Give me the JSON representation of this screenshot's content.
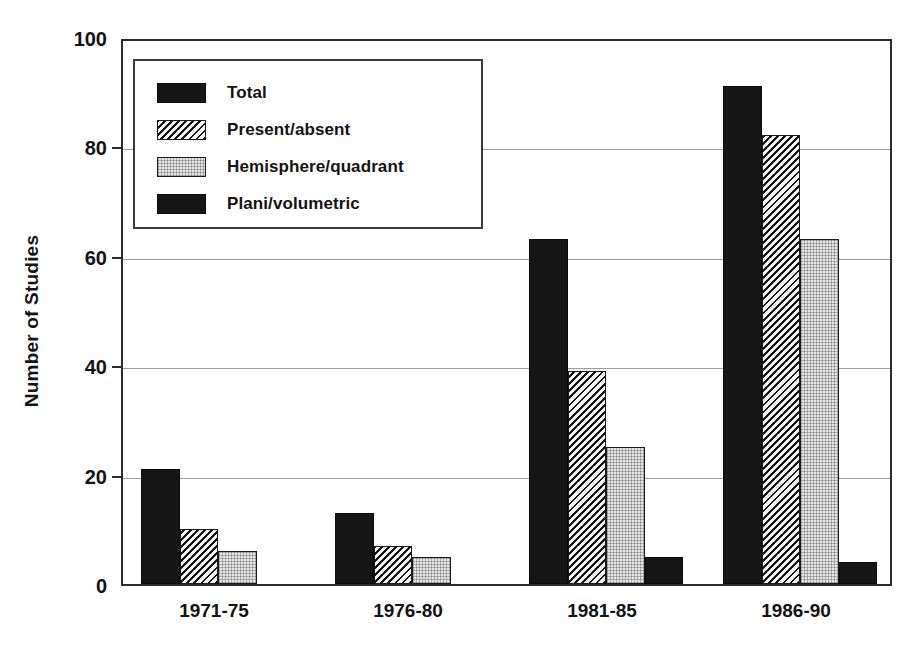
{
  "chart_data": {
    "type": "bar",
    "title": "",
    "xlabel": "",
    "ylabel": "Number of Studies",
    "categories": [
      "1971-75",
      "1976-80",
      "1981-85",
      "1986-90"
    ],
    "series": [
      {
        "name": "Total",
        "values": [
          21,
          13,
          63,
          91
        ],
        "fill": "solid-black"
      },
      {
        "name": "Present/absent",
        "values": [
          10,
          7,
          39,
          82
        ],
        "fill": "diagonal-hatch"
      },
      {
        "name": "Hemisphere/quadrant",
        "values": [
          6,
          5,
          25,
          63
        ],
        "fill": "light-dotted"
      },
      {
        "name": "Plani/volumetric",
        "values": [
          0,
          0,
          5,
          4
        ],
        "fill": "solid-black"
      }
    ],
    "ylim": [
      0,
      100
    ],
    "yticks": [
      0,
      20,
      40,
      60,
      80,
      100
    ],
    "ytick_labels": [
      "0",
      "20",
      "40",
      "60",
      "80",
      "100"
    ],
    "grid": "horizontal",
    "legend_position": "upper-left-inside",
    "legend_entries": [
      "Total",
      "Present/absent",
      "Hemisphere/quadrant",
      "Plani/volumetric"
    ],
    "colors": {
      "bar_black": "#161616",
      "bar_hatch_ink": "#141414",
      "bar_dot_ink": "#b9b9b9",
      "axis": "#2b2b2b",
      "gridline": "#9d9d9d",
      "text": "#131313",
      "background": "#ffffff"
    }
  }
}
